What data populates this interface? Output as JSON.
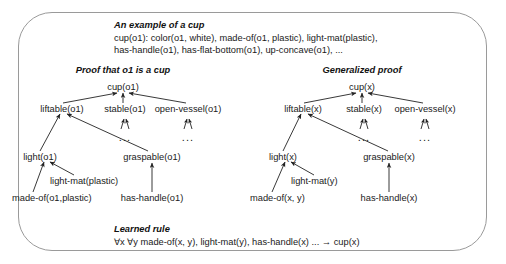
{
  "figure": {
    "kind": "explanation-based-learning-diagram"
  },
  "example_block": {
    "title": "An example of a cup",
    "lines": [
      "cup(o1): color(o1, white), made-of(o1, plastic), light-mat(plastic),",
      "has-handle(o1), has-flat-bottom(o1), up-concave(o1), ..."
    ]
  },
  "left_tree": {
    "heading": "Proof that o1 is a cup",
    "nodes": {
      "root": "cup(o1)",
      "liftable": "liftable(o1)",
      "stable": "stable(o1)",
      "open_vessel": "open-vessel(o1)",
      "light": "light(o1)",
      "graspable": "graspable(o1)",
      "light_mat": "light-mat(plastic)",
      "made_of": "made-of(o1,plastic)",
      "has_handle": "has-handle(o1)",
      "ellipsis_stable": "...",
      "ellipsis_open_vessel": "..."
    }
  },
  "right_tree": {
    "heading": "Generalized proof",
    "nodes": {
      "root": "cup(x)",
      "liftable": "liftable(x)",
      "stable": "stable(x)",
      "open_vessel": "open-vessel(x)",
      "light": "light(x)",
      "graspable": "graspable(x)",
      "light_mat": "light-mat(y)",
      "made_of": "made-of(x, y)",
      "has_handle": "has-handle(x)",
      "ellipsis_stable": "...",
      "ellipsis_open_vessel": "..."
    }
  },
  "rule_block": {
    "title": "Learned rule",
    "text": "∀x ∀y made-of(x, y), light-mat(y), has-handle(x) ... → cup(x)"
  },
  "colors": {
    "border": "#9a9a9a",
    "text": "#1a1a1a",
    "edge": "#222222",
    "background": "#ffffff"
  }
}
